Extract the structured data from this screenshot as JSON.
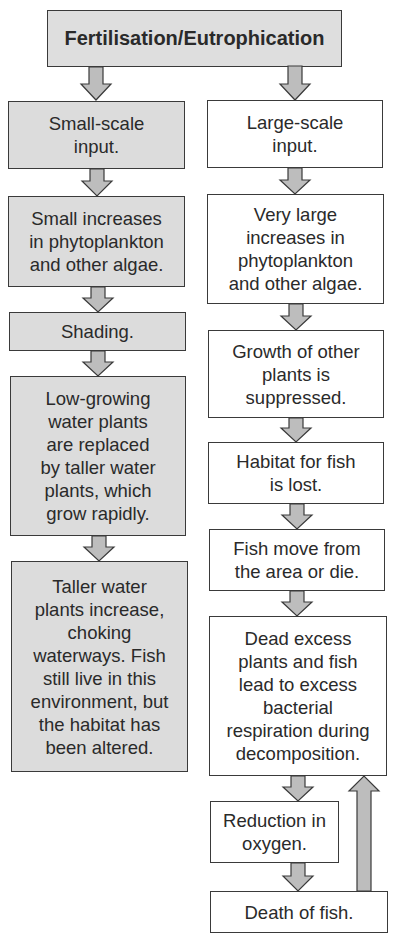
{
  "title": "Fertilisation/Eutrophication",
  "left_column": {
    "boxes": [
      {
        "text": "Small-scale\ninput."
      },
      {
        "text": "Small increases\nin phytoplankton\nand other algae."
      },
      {
        "text": "Shading."
      },
      {
        "text": "Low-growing\nwater plants\nare replaced\nby taller water\nplants, which\ngrow rapidly."
      },
      {
        "text": "Taller water\nplants increase,\nchoking\nwaterways. Fish\nstill live in this\nenvironment, but\nthe habitat has\nbeen altered."
      }
    ]
  },
  "right_column": {
    "boxes": [
      {
        "text": "Large-scale\ninput."
      },
      {
        "text": "Very large\nincreases in\nphytoplankton\nand other algae."
      },
      {
        "text": "Growth of other\nplants is\nsuppressed."
      },
      {
        "text": "Habitat for fish\nis lost."
      },
      {
        "text": "Fish move from\nthe area or die."
      },
      {
        "text": "Dead excess\nplants and fish\nlead to excess\nbacterial\nrespiration during\ndecomposition."
      },
      {
        "text": "Reduction in\noxygen."
      },
      {
        "text": "Death of fish."
      }
    ]
  },
  "colors": {
    "shaded_box": "#dcdcdc",
    "arrow_fill": "#bdbdbd",
    "border": "#3a3a3a"
  }
}
